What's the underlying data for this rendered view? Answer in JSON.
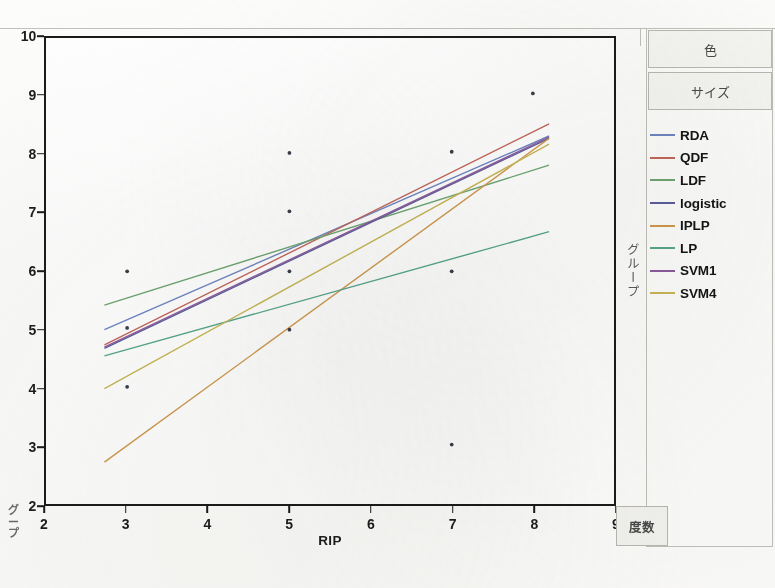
{
  "window": {
    "right_axis_title": "グループ",
    "left_group_label_chars": [
      "グ",
      "ー",
      "プ"
    ],
    "frequency_cell_label": "度数"
  },
  "controls": [
    {
      "name": "color-panel",
      "label": "色"
    },
    {
      "name": "size-panel",
      "label": "サイズ"
    }
  ],
  "chart_data": {
    "type": "scatter",
    "title": "",
    "xlabel": "RIP",
    "ylabel": "",
    "xlim": [
      2,
      9
    ],
    "ylim": [
      2,
      10
    ],
    "xticks": [
      2,
      3,
      4,
      5,
      6,
      7,
      8,
      9
    ],
    "yticks": [
      2,
      3,
      4,
      5,
      6,
      7,
      8,
      9,
      10
    ],
    "grid": false,
    "legend_position": "right",
    "points": [
      {
        "x": 3.0,
        "y": 6.0
      },
      {
        "x": 3.0,
        "y": 5.03
      },
      {
        "x": 3.0,
        "y": 4.02
      },
      {
        "x": 5.0,
        "y": 8.03
      },
      {
        "x": 5.0,
        "y": 7.03
      },
      {
        "x": 5.0,
        "y": 6.0
      },
      {
        "x": 5.0,
        "y": 5.0
      },
      {
        "x": 7.0,
        "y": 8.05
      },
      {
        "x": 7.0,
        "y": 6.0
      },
      {
        "x": 7.0,
        "y": 3.03
      },
      {
        "x": 8.0,
        "y": 9.05
      }
    ],
    "point_color": "#3a3f4a",
    "fit_x_range": [
      2.72,
      8.2
    ],
    "series": [
      {
        "name": "RDA",
        "color": "#6f86c4",
        "y_start": 5.0,
        "y_end": 8.32
      },
      {
        "name": "QDF",
        "color": "#c4675c",
        "y_start": 4.74,
        "y_end": 8.53
      },
      {
        "name": "LDF",
        "color": "#6fa672",
        "y_start": 5.42,
        "y_end": 7.82
      },
      {
        "name": "logistic",
        "color": "#5b5f9e",
        "y_start": 4.68,
        "y_end": 8.28
      },
      {
        "name": "IPLP",
        "color": "#d09a4e",
        "y_start": 2.73,
        "y_end": 8.28
      },
      {
        "name": "LP",
        "color": "#57a88c",
        "y_start": 4.55,
        "y_end": 6.68
      },
      {
        "name": "SVM1",
        "color": "#8c5b9e",
        "y_start": 4.7,
        "y_end": 8.3
      },
      {
        "name": "SVM4",
        "color": "#c9b755",
        "y_start": 3.99,
        "y_end": 8.18
      }
    ]
  }
}
